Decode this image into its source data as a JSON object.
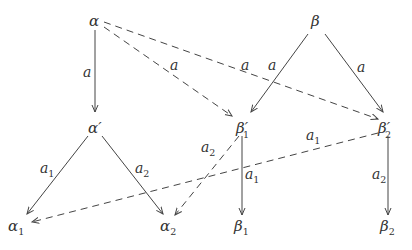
{
  "diagram": {
    "nodes": [
      {
        "id": "alpha",
        "label": "α",
        "x": 95,
        "y": 22
      },
      {
        "id": "beta",
        "label": "β",
        "x": 317,
        "y": 22
      },
      {
        "id": "alpha_prime",
        "label": "α′",
        "x": 95,
        "y": 128
      },
      {
        "id": "beta1_prime",
        "label": "β′₁",
        "x": 247,
        "y": 128
      },
      {
        "id": "beta2_prime",
        "label": "β′₂",
        "x": 389,
        "y": 128
      },
      {
        "id": "alpha1",
        "label": "α₁",
        "x": 15,
        "y": 226
      },
      {
        "id": "alpha2",
        "label": "α₂",
        "x": 165,
        "y": 226
      },
      {
        "id": "beta1",
        "label": "β₁",
        "x": 243,
        "y": 226
      },
      {
        "id": "beta2",
        "label": "β₂",
        "x": 389,
        "y": 226
      }
    ],
    "edges": [
      {
        "from": "alpha",
        "to": "alpha_prime",
        "label": "a",
        "style": "solid"
      },
      {
        "from": "alpha",
        "to": "beta1_prime",
        "label": "a",
        "style": "dashed"
      },
      {
        "from": "alpha",
        "to": "beta2_prime",
        "label": "a",
        "style": "dashed"
      },
      {
        "from": "beta",
        "to": "beta1_prime",
        "label": "a",
        "style": "solid"
      },
      {
        "from": "beta",
        "to": "beta2_prime",
        "label": "a",
        "style": "solid"
      },
      {
        "from": "alpha_prime",
        "to": "alpha1",
        "label": "a₁",
        "style": "solid"
      },
      {
        "from": "alpha_prime",
        "to": "alpha2",
        "label": "a₂",
        "style": "solid"
      },
      {
        "from": "beta1_prime",
        "to": "beta1",
        "label": "a₁",
        "style": "solid"
      },
      {
        "from": "beta1_prime",
        "to": "alpha2",
        "label": "a₂",
        "style": "dashed"
      },
      {
        "from": "beta2_prime",
        "to": "alpha1",
        "label": "a₁",
        "style": "dashed"
      },
      {
        "from": "beta2_prime",
        "to": "beta2",
        "label": "a₂",
        "style": "solid"
      }
    ],
    "text": {
      "alpha": "α",
      "beta": "β",
      "alpha_prime": "α′",
      "beta_prime": "β′",
      "alpha_letter": "α",
      "beta_letter": "β",
      "sub1": "1",
      "sub2": "2",
      "a": "a"
    }
  }
}
